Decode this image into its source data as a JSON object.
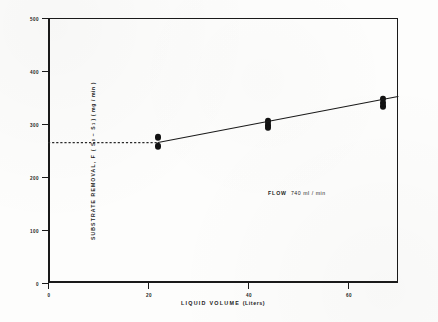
{
  "chart_data": {
    "type": "scatter",
    "title": "",
    "xlabel": "LIQUID VOLUME (Liters)",
    "xlabel_main": "LIQUID  VOLUME",
    "xlabel_units": "(Liters)",
    "ylabel": "SUBSTRATE REMOVAL, F(S0 - S1) (mg/min)",
    "ylabel_part1": "SUBSTRATE   REMOVAL,   F ( S",
    "ylabel_sub0": "0",
    "ylabel_part2": " − S",
    "ylabel_sub1": "1",
    "ylabel_part3": " ) ( mg / min )",
    "xlim": [
      0,
      70
    ],
    "ylim": [
      0,
      500
    ],
    "xticks": [
      0,
      20,
      40,
      60
    ],
    "yticks": [
      0,
      100,
      200,
      300,
      400,
      500
    ],
    "grid": false,
    "legend": "none",
    "points": [
      {
        "x": 22,
        "y": 275
      },
      {
        "x": 22,
        "y": 258
      },
      {
        "x": 44,
        "y": 305
      },
      {
        "x": 44,
        "y": 298
      },
      {
        "x": 44,
        "y": 293
      },
      {
        "x": 67,
        "y": 348
      },
      {
        "x": 67,
        "y": 340
      },
      {
        "x": 67,
        "y": 334
      }
    ],
    "fit_line": {
      "name": "fitted trend line",
      "x": [
        22,
        70
      ],
      "y": [
        265,
        352
      ]
    },
    "reference_line": {
      "name": "dashed baseline",
      "style": "dashed",
      "y": 265,
      "x_start": 0,
      "x_end": 22
    },
    "annotations": [
      {
        "name": "flow-rate",
        "label": "FLOW",
        "value": "740 ml / min",
        "x": 40,
        "y": 175
      }
    ],
    "colors": {
      "ink": "#1a1a1a",
      "marker": "#121212",
      "background": "#fdfdfc"
    }
  }
}
